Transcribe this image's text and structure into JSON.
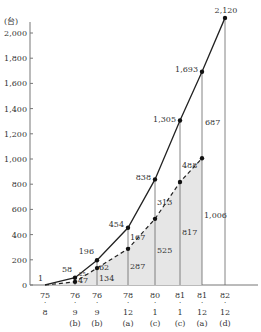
{
  "chart_data": {
    "type": "line",
    "title": "",
    "ylabel": "(台)",
    "xlabel": "",
    "ylim": [
      0,
      2100
    ],
    "y_ticks": [
      "0",
      "200",
      "400",
      "600",
      "800",
      "1,000",
      "1,200",
      "1,400",
      "1,600",
      "1,800",
      "2,000"
    ],
    "y_tick_values": [
      0,
      200,
      400,
      600,
      800,
      1000,
      1200,
      1400,
      1600,
      1800,
      2000
    ],
    "categories": [
      {
        "year": "75",
        "month": "8",
        "src": ""
      },
      {
        "year": "76",
        "month": "9",
        "src": "(b)"
      },
      {
        "year": "76",
        "month": "9",
        "src": "(b)"
      },
      {
        "year": "78",
        "month": "12",
        "src": "(a)"
      },
      {
        "year": "80",
        "month": "1",
        "src": "(c)"
      },
      {
        "year": "81",
        "month": "1",
        "src": "(c)"
      },
      {
        "year": "81",
        "month": "12",
        "src": "(a)"
      },
      {
        "year": "82",
        "month": "12",
        "src": "(d)"
      }
    ],
    "series": [
      {
        "name": "total",
        "style": "solid",
        "values": [
          1,
          58,
          196,
          454,
          838,
          1305,
          1693,
          2120
        ],
        "labels": [
          "1",
          "58",
          "196",
          "454",
          "838",
          "1,305",
          "1,693",
          "2,120"
        ]
      },
      {
        "name": "lower",
        "style": "dashed",
        "values": [
          0,
          25,
          134,
          287,
          525,
          817,
          1006,
          null
        ],
        "labels": [
          "",
          "",
          "",
          "",
          "",
          "",
          "",
          ""
        ]
      }
    ],
    "segment_labels": {
      "upper_gap": [
        "",
        "",
        "62",
        "167",
        "313",
        "488",
        "687",
        ""
      ],
      "lower_fill": [
        "",
        "47",
        "134",
        "287",
        "525",
        "817",
        "1,006",
        ""
      ]
    },
    "small_labels": [
      "25"
    ],
    "grid": false,
    "legend": "none"
  }
}
